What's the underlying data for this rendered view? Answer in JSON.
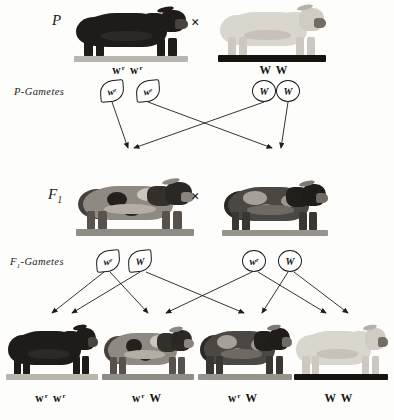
{
  "rows": {
    "p": {
      "label": "P",
      "gamete_label": "P-Gametes",
      "cross_symbol": "×"
    },
    "f1": {
      "label_main": "F",
      "label_sub": "1",
      "gamete_label_main": "F",
      "gamete_label_sub": "1",
      "gamete_label_rest": "-Gametes",
      "cross_symbol": "×"
    }
  },
  "p_generation": {
    "animals": [
      {
        "name": "red-shorthorn-bull",
        "phenotype": "red",
        "genotype_base": "w",
        "genotype_sup": "r",
        "genotype_text": "w w"
      },
      {
        "name": "white-shorthorn-cow",
        "phenotype": "white",
        "genotype_base": "",
        "genotype_sup": "",
        "genotype_text": "W W"
      }
    ]
  },
  "p_gametes": [
    {
      "name": "p-gamete-wr-1",
      "allele": "w",
      "sup": "r",
      "shape": "leaf"
    },
    {
      "name": "p-gamete-wr-2",
      "allele": "w",
      "sup": "r",
      "shape": "leaf"
    },
    {
      "name": "p-gamete-W-1",
      "allele": "W",
      "sup": "",
      "shape": "round"
    },
    {
      "name": "p-gamete-W-2",
      "allele": "W",
      "sup": "",
      "shape": "round"
    }
  ],
  "f1_generation": {
    "animals": [
      {
        "name": "roan-shorthorn-bull",
        "phenotype": "roan",
        "genotype_text": ""
      },
      {
        "name": "roan-shorthorn-cow",
        "phenotype": "roan",
        "genotype_text": ""
      }
    ]
  },
  "f1_gametes": [
    {
      "name": "f1-gamete-wr-1",
      "allele": "w",
      "sup": "r",
      "shape": "leaf"
    },
    {
      "name": "f1-gamete-W-1",
      "allele": "W",
      "sup": "",
      "shape": "leaf"
    },
    {
      "name": "f1-gamete-wr-2",
      "allele": "w",
      "sup": "r",
      "shape": "round"
    },
    {
      "name": "f1-gamete-W-2",
      "allele": "W",
      "sup": "",
      "shape": "round"
    }
  ],
  "f2_generation": {
    "offspring": [
      {
        "name": "f2-offspring-red",
        "phenotype": "red",
        "genotype_text": "w w",
        "base": "w",
        "sup": "r"
      },
      {
        "name": "f2-offspring-roan-1",
        "phenotype": "roan",
        "genotype_text": "w W",
        "base": "w",
        "sup": "r"
      },
      {
        "name": "f2-offspring-roan-2",
        "phenotype": "roan",
        "genotype_text": "w W",
        "base": "w",
        "sup": "r"
      },
      {
        "name": "f2-offspring-white",
        "phenotype": "white",
        "genotype_text": "W W",
        "base": "",
        "sup": ""
      }
    ]
  },
  "colors": {
    "ink": "#1a1a1a",
    "paper": "#fdfdfb",
    "red_coat": "#1e1b19",
    "white_coat": "#d9d6ce",
    "roan_coat": "#8e8a82"
  }
}
